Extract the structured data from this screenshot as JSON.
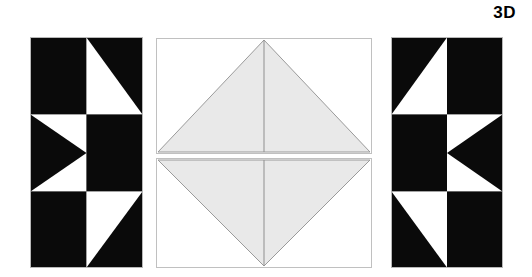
{
  "figure": {
    "label": "3D",
    "label_name": "3d-corner-label",
    "background_color": "#ffffff",
    "ink_color": "#000000",
    "fill_gray": "#e9e9e9",
    "stroke_gray": "#9a9a9a",
    "panel_border": "#c8c8c8"
  },
  "panels": [
    {
      "id": "left",
      "title": "left-pattern-panel",
      "description": "2 by 3 grid of black and white half-square triangle blocks",
      "grid": {
        "cols": 2,
        "rows": 3
      },
      "cells": [
        {
          "row": 0,
          "col": 0,
          "fill": "black",
          "shape": "solid"
        },
        {
          "row": 0,
          "col": 1,
          "fill": "black",
          "shape": "triangle-white-top-left"
        },
        {
          "row": 1,
          "col": 0,
          "fill": "black",
          "shape": "triangle-white-top-and-bottom-left-arrow"
        },
        {
          "row": 1,
          "col": 1,
          "fill": "black",
          "shape": "solid"
        },
        {
          "row": 2,
          "col": 0,
          "fill": "black",
          "shape": "solid"
        },
        {
          "row": 2,
          "col": 1,
          "fill": "black",
          "shape": "triangle-white-bottom-left"
        }
      ]
    },
    {
      "id": "right",
      "title": "right-pattern-panel",
      "description": "Mirror image of the left pattern panel",
      "grid": {
        "cols": 2,
        "rows": 3
      },
      "cells": [
        {
          "row": 0,
          "col": 0,
          "fill": "black",
          "shape": "triangle-white-top-right"
        },
        {
          "row": 0,
          "col": 1,
          "fill": "black",
          "shape": "solid"
        },
        {
          "row": 1,
          "col": 0,
          "fill": "black",
          "shape": "solid"
        },
        {
          "row": 1,
          "col": 1,
          "fill": "black",
          "shape": "triangle-white-top-and-bottom-right-arrow"
        },
        {
          "row": 2,
          "col": 0,
          "fill": "black",
          "shape": "triangle-white-bottom-right"
        },
        {
          "row": 2,
          "col": 1,
          "fill": "black",
          "shape": "solid"
        }
      ]
    },
    {
      "id": "center-top",
      "title": "center-top-panel",
      "description": "Rectangle containing a gray isoceles triangle with apex at top center and base along the bottom edge, split by a vertical center line",
      "shape": "triangle-apex-top",
      "has_center_line": true
    },
    {
      "id": "center-bottom",
      "title": "center-bottom-panel",
      "description": "Rectangle containing a gray inverted isoceles triangle with apex at bottom center and base along the top edge, split by a vertical center line",
      "shape": "triangle-apex-bottom",
      "has_center_line": true
    }
  ]
}
